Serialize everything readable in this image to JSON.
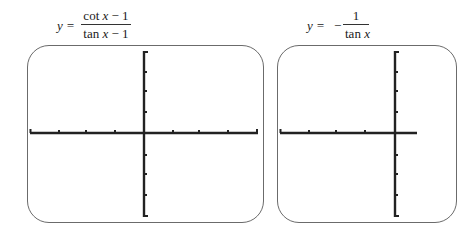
{
  "figures": [
    {
      "id": "left",
      "equation": {
        "lhs": "y =",
        "numerator": "cot x − 1",
        "denominator": "tan x − 1",
        "numerator_parts": [
          "cot ",
          "x",
          " − 1"
        ],
        "denominator_parts": [
          "tan ",
          "x",
          " − 1"
        ]
      },
      "graph": {
        "content": "blank axes (no curve drawn)",
        "x_ticks_each_side": 4,
        "y_ticks_each_side": 4
      }
    },
    {
      "id": "right",
      "equation": {
        "lhs": "y =",
        "sign": "−",
        "numerator": "1",
        "denominator": "tan x",
        "denominator_parts": [
          "tan ",
          "x"
        ]
      },
      "graph": {
        "content": "blank axes (no curve drawn), cropped at right edge",
        "x_ticks_each_side": 4,
        "y_ticks_each_side": 4
      }
    }
  ],
  "colors": {
    "axis": "#222222",
    "frame": "#6b6b6b",
    "background": "#ffffff"
  }
}
